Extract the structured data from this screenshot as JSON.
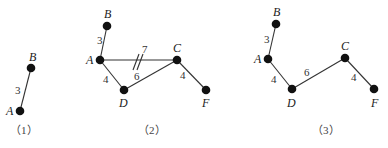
{
  "figures": [
    {
      "caption": "（1）",
      "nodes": [
        {
          "id": "A",
          "label": "A",
          "x": 20,
          "y": 111
        },
        {
          "id": "B",
          "label": "B",
          "x": 31,
          "y": 68
        }
      ],
      "edges": [
        {
          "from": "A",
          "to": "B",
          "weight": "3"
        }
      ]
    },
    {
      "caption": "（2）",
      "nodes": [
        {
          "id": "B",
          "label": "B",
          "x": 107,
          "y": 26
        },
        {
          "id": "A",
          "label": "A",
          "x": 100,
          "y": 60
        },
        {
          "id": "C",
          "label": "C",
          "x": 177,
          "y": 60
        },
        {
          "id": "D",
          "label": "D",
          "x": 124,
          "y": 90
        },
        {
          "id": "F",
          "label": "F",
          "x": 206,
          "y": 90
        }
      ],
      "edges": [
        {
          "from": "A",
          "to": "B",
          "weight": "3"
        },
        {
          "from": "A",
          "to": "C",
          "weight": "7",
          "crossed_out": true
        },
        {
          "from": "A",
          "to": "D",
          "weight": "4"
        },
        {
          "from": "D",
          "to": "C",
          "weight": "6"
        },
        {
          "from": "C",
          "to": "F",
          "weight": "4"
        }
      ]
    },
    {
      "caption": "（3）",
      "nodes": [
        {
          "id": "B",
          "label": "B",
          "x": 276,
          "y": 24
        },
        {
          "id": "A",
          "label": "A",
          "x": 268,
          "y": 59
        },
        {
          "id": "D",
          "label": "D",
          "x": 292,
          "y": 89
        },
        {
          "id": "C",
          "label": "C",
          "x": 345,
          "y": 58
        },
        {
          "id": "F",
          "label": "F",
          "x": 374,
          "y": 89
        }
      ],
      "edges": [
        {
          "from": "A",
          "to": "B",
          "weight": "3"
        },
        {
          "from": "A",
          "to": "D",
          "weight": "4"
        },
        {
          "from": "D",
          "to": "C",
          "weight": "6"
        },
        {
          "from": "C",
          "to": "F",
          "weight": "4"
        }
      ]
    }
  ]
}
